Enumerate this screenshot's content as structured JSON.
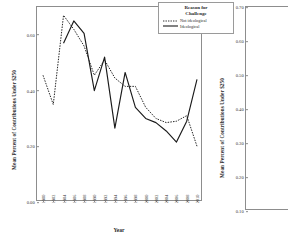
{
  "figure": {
    "panels": 2,
    "note_visible_text_only": true
  },
  "left_panel": {
    "ylabel": "Mean Percent of Contributions Under $250",
    "xlabel": "Year",
    "legend": {
      "title_line1": "Reason for",
      "title_line2": "Challenge",
      "entries": [
        {
          "label": "Not ideological",
          "style": "dotted"
        },
        {
          "label": "Ideological",
          "style": "solid"
        }
      ]
    }
  },
  "right_panel": {
    "ylabel": "Mean Percent of Contributions Under $250"
  },
  "colors": {
    "line": "#1a1a1a",
    "axis": "#8d8d8d",
    "text": "#2b2b2b",
    "background": "#ffffff"
  },
  "chart_data": [
    {
      "type": "line",
      "panel": "left",
      "title": "",
      "xlabel": "Year",
      "ylabel": "Mean Percent of Contributions Under $250",
      "ylim": [
        0.0,
        0.7
      ],
      "yticks": [
        0.0,
        0.2,
        0.4,
        0.6
      ],
      "ytick_labels": [
        "0.00",
        "0.20",
        "0.40",
        "0.60"
      ],
      "grid": false,
      "legend_position": "top-right",
      "categories": [
        "1980",
        "1982",
        "1984",
        "1986",
        "1988",
        "1990",
        "1992",
        "1994",
        "1996",
        "1998",
        "2000",
        "2002",
        "2004",
        "2006",
        "2008",
        "2010"
      ],
      "series": [
        {
          "name": "Not ideological",
          "style": "dotted",
          "values": [
            0.455,
            0.35,
            0.67,
            0.62,
            0.56,
            0.455,
            0.51,
            0.445,
            0.415,
            0.415,
            0.34,
            0.3,
            0.285,
            0.29,
            0.31,
            0.2
          ]
        },
        {
          "name": "Ideological",
          "style": "solid",
          "values": [
            null,
            null,
            0.57,
            0.65,
            0.605,
            0.4,
            0.52,
            0.265,
            0.465,
            0.34,
            0.3,
            0.285,
            0.255,
            0.215,
            0.29,
            0.44
          ]
        }
      ]
    },
    {
      "type": "line",
      "panel": "right",
      "cropped": true,
      "title": "",
      "xlabel": "",
      "ylabel": "Mean Percent of Contributions Under $250",
      "ylim": [
        0.1,
        0.7
      ],
      "yticks": [
        0.1,
        0.2,
        0.3,
        0.4,
        0.5,
        0.6,
        0.7
      ],
      "ytick_labels": [
        "0.10",
        "0.20",
        "0.30",
        "0.40",
        "0.50",
        "0.60",
        "0.70"
      ],
      "grid": false,
      "categories": [],
      "series": []
    }
  ]
}
